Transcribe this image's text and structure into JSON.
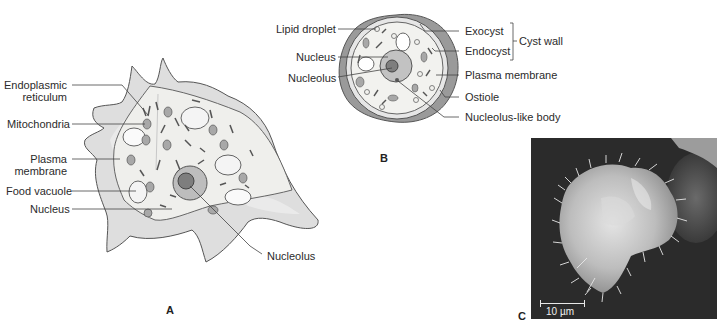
{
  "panel_a": {
    "letter": "A",
    "labels": {
      "endoplasmic_reticulum_line1": "Endoplasmic",
      "endoplasmic_reticulum_line2": "reticulum",
      "mitochondria": "Mitochondria",
      "plasma_membrane_line1": "Plasma",
      "plasma_membrane_line2": "membrane",
      "food_vacuole": "Food vacuole",
      "nucleus": "Nucleus",
      "nucleolus": "Nucleolus"
    }
  },
  "panel_b": {
    "letter": "B",
    "labels": {
      "lipid_droplet": "Lipid droplet",
      "nucleus": "Nucleus",
      "nucleolus": "Nucleolus",
      "exocyst": "Exocyst",
      "endocyst": "Endocyst",
      "cyst_wall": "Cyst wall",
      "plasma_membrane": "Plasma membrane",
      "ostiole": "Ostiole",
      "nucleolus_like_body": "Nucleolus-like body"
    }
  },
  "panel_c": {
    "letter": "C",
    "scale_bar": "10 µm"
  },
  "colors": {
    "cell_outer": "#dcdcdc",
    "cell_inner": "#eeeeec",
    "nucleus": "#b9b9b9",
    "nucleolus": "#7e7e7e",
    "sem_background": "#2a2a2a",
    "sem_cell": "#cfcfcf"
  }
}
